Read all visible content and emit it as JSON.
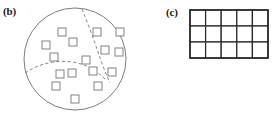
{
  "figure": {
    "background_color": "#ffffff",
    "width": 275,
    "height": 117
  },
  "panels": [
    {
      "id": "b",
      "label": "(b)",
      "type": "partitioned-domain",
      "description": "Circular domain containing scattered square nodes, subdivided by dashed curves into three subregions",
      "domain": {
        "shape": "circle",
        "cx": 75,
        "cy": 59,
        "rx": 51,
        "ry": 51,
        "stroke_color": "#6e6e6e"
      },
      "partition_curves": [
        {
          "name": "vertical-dashed-curve",
          "path": "M 82 9 C 88 24, 94 40, 99 55 C 102 64, 106 74, 110 83",
          "stroke_color": "#7a7a7a",
          "dash": "3.2 2.4"
        },
        {
          "name": "horizontal-dashed-curve",
          "path": "M 25 73 C 40 63, 56 60, 72 62 C 86 64, 96 70, 106 80",
          "stroke_color": "#7a7a7a",
          "dash": "3.2 2.4"
        }
      ],
      "node_count": 16,
      "node_size": 8,
      "node_fill": "#ffffff",
      "node_stroke": "#767676",
      "nodes": [
        {
          "cx": 62,
          "cy": 32
        },
        {
          "cx": 97,
          "cy": 32
        },
        {
          "cx": 120,
          "cy": 32
        },
        {
          "cx": 46,
          "cy": 45
        },
        {
          "cx": 73,
          "cy": 42
        },
        {
          "cx": 105,
          "cy": 50
        },
        {
          "cx": 119,
          "cy": 52
        },
        {
          "cx": 54,
          "cy": 57
        },
        {
          "cx": 86,
          "cy": 60
        },
        {
          "cx": 60,
          "cy": 74
        },
        {
          "cx": 72,
          "cy": 73
        },
        {
          "cx": 93,
          "cy": 71
        },
        {
          "cx": 112,
          "cy": 72
        },
        {
          "cx": 56,
          "cy": 86
        },
        {
          "cx": 98,
          "cy": 86
        },
        {
          "cx": 75,
          "cy": 99
        }
      ]
    },
    {
      "id": "c",
      "label": "(c)",
      "type": "structured-grid",
      "description": "Regular rectangular mesh of uniform cells",
      "grid": {
        "columns": 5,
        "rows": 3,
        "origin_x": 190,
        "origin_y": 10,
        "cell_width": 15.6,
        "cell_height": 16,
        "stroke_color": "#2b2b2b",
        "fill_color": "#ffffff"
      }
    }
  ]
}
